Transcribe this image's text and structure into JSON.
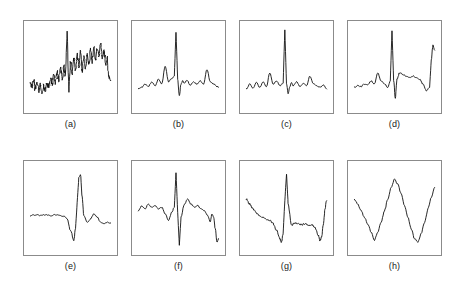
{
  "figure": {
    "background_color": "#ffffff",
    "frame_color": "#8b8b8b",
    "trace_color": "#111111",
    "rows": 2,
    "columns": 4,
    "panel_count": 8
  },
  "panels": [
    {
      "id": "a",
      "caption": "(a)",
      "x": 23,
      "y": 20,
      "width": 95,
      "height": 94,
      "caption_y": 119,
      "signal_name": "noisy-irregular-waveform"
    },
    {
      "id": "b",
      "caption": "(b)",
      "x": 131,
      "y": 20,
      "width": 95,
      "height": 94,
      "caption_y": 119,
      "signal_name": "ecg-beat-with-small-peaks"
    },
    {
      "id": "c",
      "caption": "(c)",
      "x": 239,
      "y": 20,
      "width": 95,
      "height": 94,
      "caption_y": 119,
      "signal_name": "ecg-normal-sharp-qrs"
    },
    {
      "id": "d",
      "caption": "(d)",
      "x": 347,
      "y": 20,
      "width": 95,
      "height": 94,
      "caption_y": 119,
      "signal_name": "ecg-with-elevated-baseline"
    },
    {
      "id": "e",
      "caption": "(e)",
      "x": 23,
      "y": 160,
      "width": 95,
      "height": 96,
      "caption_y": 261,
      "signal_name": "flat-baseline-then-large-spike"
    },
    {
      "id": "f",
      "caption": "(f)",
      "x": 131,
      "y": 160,
      "width": 95,
      "height": 96,
      "caption_y": 261,
      "signal_name": "ecg-biphasic-deep-qrs"
    },
    {
      "id": "g",
      "caption": "(g)",
      "x": 239,
      "y": 160,
      "width": 95,
      "height": 96,
      "caption_y": 261,
      "signal_name": "ecg-descending-baseline-with-spike"
    },
    {
      "id": "h",
      "caption": "(h)",
      "x": 347,
      "y": 160,
      "width": 95,
      "height": 96,
      "caption_y": 261,
      "signal_name": "smooth-double-valley-wave"
    }
  ],
  "chart_data": {
    "type": "line",
    "title": "",
    "xlabel": "",
    "ylabel": "",
    "grid": false,
    "legend": "none",
    "note": "Eight small multiples of single-channel biosignal (ECG-like) traces; y is amplitude in arbitrary units normalised to 0-100, x is sample index normalised to 0-100.",
    "xlim": [
      0,
      100
    ],
    "ylim": [
      0,
      100
    ],
    "series": [
      {
        "name": "(a)",
        "label": "noisy irregular waveform",
        "x": [
          2,
          4,
          6,
          8,
          10,
          12,
          14,
          16,
          18,
          20,
          22,
          24,
          26,
          28,
          30,
          32,
          34,
          36,
          38,
          40,
          42,
          44,
          46,
          48,
          50,
          52,
          54,
          56,
          58,
          60,
          62,
          64,
          66,
          68,
          70,
          72,
          74,
          76,
          78,
          80,
          82,
          84,
          86,
          88,
          90,
          92,
          94,
          96,
          98
        ],
        "y": [
          30,
          26,
          33,
          24,
          31,
          22,
          29,
          20,
          27,
          23,
          31,
          26,
          36,
          29,
          40,
          32,
          44,
          35,
          48,
          34,
          52,
          42,
          96,
          20,
          58,
          44,
          62,
          48,
          66,
          52,
          70,
          46,
          64,
          50,
          68,
          54,
          72,
          58,
          76,
          60,
          74,
          64,
          78,
          62,
          70,
          56,
          62,
          38,
          34
        ]
      },
      {
        "name": "(b)",
        "label": "ECG beat with small peaks",
        "x": [
          2,
          6,
          10,
          14,
          18,
          22,
          26,
          30,
          34,
          38,
          42,
          45,
          47,
          49,
          51,
          53,
          55,
          57,
          60,
          64,
          68,
          72,
          76,
          80,
          84,
          88,
          92,
          96,
          98
        ],
        "y": [
          24,
          26,
          30,
          27,
          33,
          28,
          36,
          30,
          52,
          33,
          37,
          40,
          94,
          36,
          16,
          30,
          34,
          31,
          35,
          29,
          33,
          30,
          34,
          30,
          48,
          33,
          30,
          27,
          26
        ]
      },
      {
        "name": "(c)",
        "label": "ECG normal sharp QRS",
        "x": [
          2,
          6,
          10,
          14,
          18,
          22,
          26,
          30,
          34,
          38,
          42,
          46,
          48,
          50,
          52,
          54,
          56,
          58,
          62,
          66,
          70,
          74,
          78,
          82,
          86,
          90,
          94,
          98
        ],
        "y": [
          24,
          30,
          25,
          32,
          26,
          33,
          27,
          44,
          30,
          34,
          28,
          31,
          97,
          30,
          18,
          27,
          32,
          28,
          33,
          27,
          31,
          28,
          40,
          31,
          28,
          26,
          29,
          24
        ]
      },
      {
        "name": "(d)",
        "label": "ECG with elevated baseline",
        "x": [
          2,
          6,
          10,
          14,
          18,
          22,
          26,
          30,
          34,
          38,
          42,
          45,
          47,
          49,
          51,
          53,
          56,
          60,
          64,
          68,
          72,
          76,
          80,
          84,
          88,
          92,
          94,
          96,
          98
        ],
        "y": [
          26,
          28,
          27,
          30,
          29,
          34,
          30,
          44,
          34,
          30,
          26,
          34,
          96,
          34,
          12,
          36,
          44,
          42,
          40,
          38,
          40,
          38,
          36,
          30,
          22,
          26,
          60,
          78,
          72
        ]
      },
      {
        "name": "(e)",
        "label": "flat baseline then large spike",
        "x": [
          2,
          8,
          14,
          20,
          26,
          32,
          38,
          42,
          46,
          50,
          54,
          56,
          58,
          60,
          62,
          64,
          66,
          70,
          74,
          78,
          82,
          86,
          90,
          94,
          98
        ],
        "y": [
          42,
          43,
          42,
          43,
          42,
          43,
          42,
          41,
          38,
          24,
          12,
          26,
          58,
          88,
          92,
          64,
          42,
          34,
          38,
          44,
          40,
          34,
          32,
          34,
          33
        ]
      },
      {
        "name": "(f)",
        "label": "ECG biphasic deep QRS",
        "x": [
          2,
          6,
          10,
          14,
          18,
          22,
          26,
          30,
          34,
          38,
          42,
          45,
          47,
          49,
          51,
          53,
          57,
          61,
          65,
          69,
          73,
          77,
          81,
          85,
          88,
          90,
          92,
          94,
          96,
          98
        ],
        "y": [
          48,
          54,
          50,
          56,
          52,
          54,
          50,
          52,
          44,
          36,
          46,
          52,
          94,
          46,
          6,
          40,
          56,
          62,
          56,
          52,
          54,
          50,
          48,
          42,
          34,
          44,
          40,
          26,
          10,
          14
        ]
      },
      {
        "name": "(g)",
        "label": "ECG descending baseline with spike",
        "x": [
          2,
          6,
          10,
          14,
          18,
          22,
          26,
          30,
          34,
          38,
          42,
          44,
          46,
          48,
          50,
          52,
          56,
          60,
          64,
          68,
          72,
          76,
          80,
          84,
          88,
          90,
          92,
          94,
          96,
          98
        ],
        "y": [
          62,
          56,
          50,
          45,
          42,
          40,
          38,
          36,
          32,
          24,
          14,
          10,
          20,
          60,
          92,
          56,
          30,
          33,
          32,
          31,
          32,
          30,
          31,
          28,
          18,
          12,
          16,
          30,
          50,
          60
        ]
      },
      {
        "name": "(h)",
        "label": "smooth double valley wave",
        "x": [
          2,
          6,
          10,
          14,
          18,
          22,
          26,
          30,
          34,
          38,
          42,
          46,
          50,
          54,
          58,
          62,
          66,
          70,
          74,
          78,
          82,
          86,
          90,
          94,
          98
        ],
        "y": [
          62,
          56,
          48,
          40,
          32,
          22,
          12,
          22,
          34,
          48,
          62,
          76,
          86,
          80,
          68,
          54,
          40,
          26,
          14,
          10,
          20,
          34,
          50,
          64,
          76
        ]
      }
    ]
  }
}
